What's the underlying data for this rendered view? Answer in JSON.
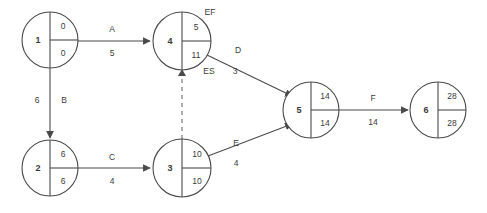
{
  "diagram": {
    "colors": {
      "stroke": "#4a4a4a",
      "dummy": "#8c8c8c",
      "text": "#3a3a3a",
      "background": "#ffffff"
    },
    "nodes": [
      {
        "id": "1",
        "ef": "0",
        "es": "0",
        "cx": 50,
        "cy": 40,
        "r": 28
      },
      {
        "id": "4",
        "ef": "5",
        "es": "11",
        "cx": 182,
        "cy": 41,
        "r": 29
      },
      {
        "id": "2",
        "ef": "6",
        "es": "6",
        "cx": 50,
        "cy": 168,
        "r": 28
      },
      {
        "id": "3",
        "ef": "10",
        "es": "10",
        "cx": 182,
        "cy": 168,
        "r": 29
      },
      {
        "id": "5",
        "ef": "14",
        "es": "14",
        "cx": 311,
        "cy": 110,
        "r": 28
      },
      {
        "id": "6",
        "ef": "28",
        "es": "28",
        "cx": 438,
        "cy": 110,
        "r": 28
      }
    ],
    "edges": [
      {
        "name": "A",
        "duration": "5",
        "from": "1",
        "to": "4",
        "style": "solid"
      },
      {
        "name": "B",
        "duration": "6",
        "from": "1",
        "to": "2",
        "style": "solid"
      },
      {
        "name": "C",
        "duration": "4",
        "from": "2",
        "to": "3",
        "style": "solid"
      },
      {
        "name": "D",
        "duration": "3",
        "from": "4",
        "to": "5",
        "style": "solid"
      },
      {
        "name": "E",
        "duration": "4",
        "from": "3",
        "to": "5",
        "style": "solid"
      },
      {
        "name": "F",
        "duration": "14",
        "from": "5",
        "to": "6",
        "style": "solid"
      },
      {
        "name": "",
        "duration": "",
        "from": "3",
        "to": "4",
        "style": "dashed"
      }
    ],
    "annotations": [
      {
        "label": "EF",
        "x": 210,
        "y": 13
      },
      {
        "label": "ES",
        "x": 209,
        "y": 72
      }
    ]
  }
}
